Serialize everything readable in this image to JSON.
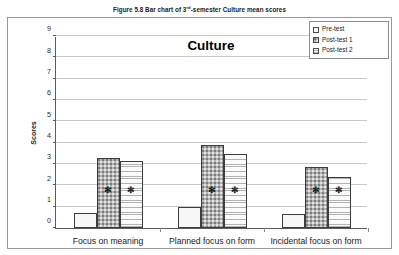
{
  "figure": {
    "caption_prefix": "Figure 5.8 Bar chart of 3",
    "caption_sup": "rd",
    "caption_suffix": "-semester Culture mean scores"
  },
  "legend": {
    "position": "top-right",
    "entries": [
      {
        "label": "Pre-test",
        "pattern": "open-white"
      },
      {
        "label": "Post-test 1",
        "pattern": "dotted-gray"
      },
      {
        "label": "Post-test 2",
        "pattern": "horizontal-lines"
      }
    ]
  },
  "axes": {
    "y_title": "Scores",
    "y_ticks": [
      "0",
      "1",
      "2",
      "3",
      "4",
      "5",
      "6",
      "7",
      "8",
      "9"
    ]
  },
  "annotations": {
    "significance_marker": "✻"
  },
  "chart_data": {
    "type": "bar",
    "title": "Culture",
    "xlabel": "",
    "ylabel": "Scores",
    "ylim": [
      0,
      9
    ],
    "ytick_step": 1,
    "grid": true,
    "legend_position": "top-right",
    "categories": [
      "Focus on meaning",
      "Planned focus on form",
      "Incidental focus on form"
    ],
    "series": [
      {
        "name": "Pre-test",
        "values": [
          0.7,
          1.0,
          0.65
        ],
        "significant": [
          false,
          false,
          false
        ]
      },
      {
        "name": "Post-test 1",
        "values": [
          3.3,
          3.9,
          2.85
        ],
        "significant": [
          true,
          true,
          true
        ]
      },
      {
        "name": "Post-test 2",
        "values": [
          3.15,
          3.45,
          2.4
        ],
        "significant": [
          true,
          true,
          true
        ]
      }
    ]
  }
}
